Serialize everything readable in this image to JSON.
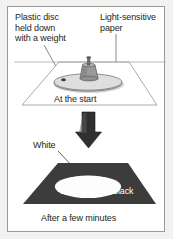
{
  "figure": {
    "background_color": "#f2f2f0",
    "frame_color": "#9a9a9a",
    "panels": [
      {
        "name": "at-the-start",
        "caption": "At the start"
      },
      {
        "name": "after-a-few-minutes",
        "caption": "After a few minutes"
      }
    ]
  },
  "labels": {
    "plastic_disc": "Plastic disc\nheld down\nwith a weight",
    "light_sensitive_paper": "Light-sensitive\npaper",
    "at_the_start": "At the start",
    "white": "White",
    "black": "Black",
    "after_a_few_minutes": "After a few minutes"
  },
  "colors": {
    "paper_dark": "#3c3c3c",
    "paper_white": "#ffffff",
    "disc_gray": "#c9c9c9",
    "weight_gray": "#8c8c8c",
    "outline_gray": "#8a8a8a",
    "arrow_dark": "#2b2b2b",
    "text_dark": "#231f20",
    "text_light": "#ffffff"
  },
  "icons": {
    "arrow": "down-arrow-icon",
    "leader_plastic_disc": "leader-line-icon",
    "leader_light_paper": "leader-line-icon",
    "leader_white": "leader-line-icon"
  }
}
